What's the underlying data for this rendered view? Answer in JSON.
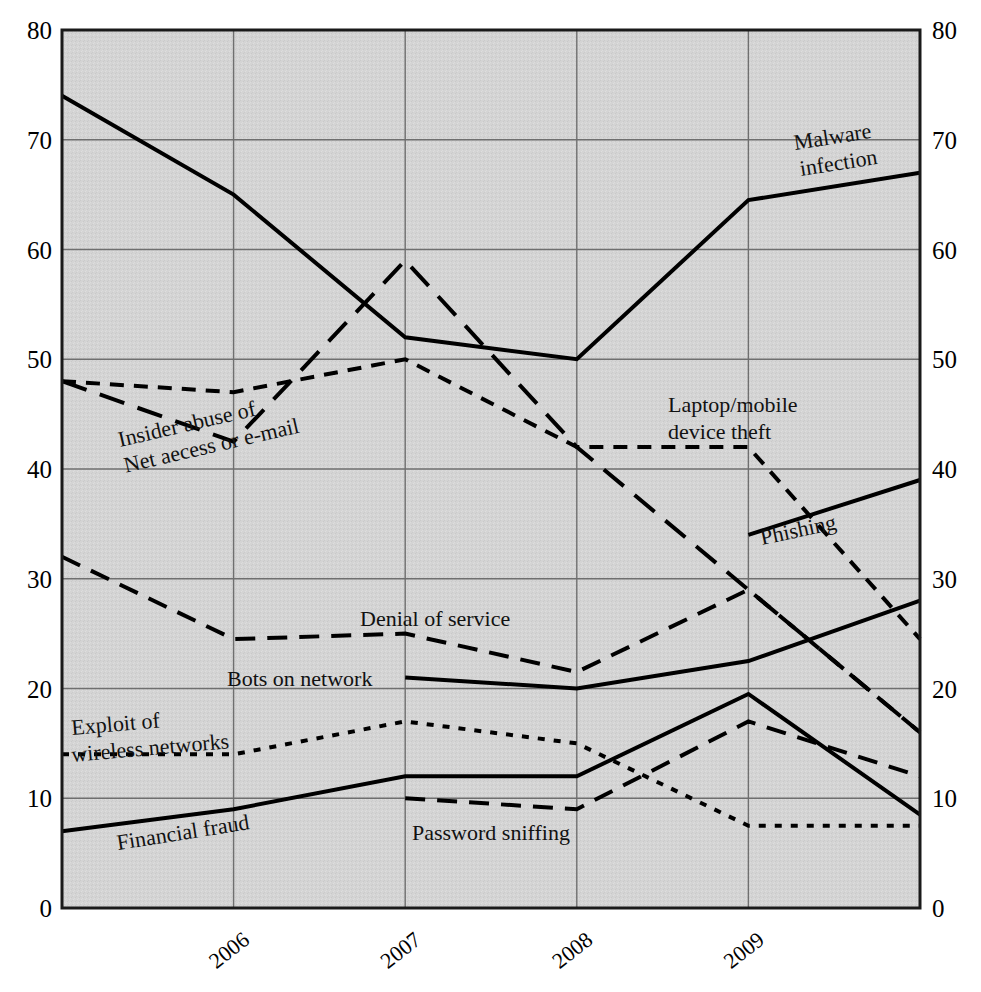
{
  "chart_data": {
    "type": "line",
    "title": "",
    "subtitle": "",
    "xlabel": "",
    "ylabel": "",
    "xlim": [
      2005,
      2010
    ],
    "ylim": [
      0,
      80
    ],
    "grid": true,
    "legend_position": "inline-annotations",
    "plot_background": "#d4d4d4",
    "x": [
      2005,
      2006,
      2007,
      2008,
      2009,
      2010
    ],
    "x_tick_labels": [
      "2006",
      "2007",
      "2008",
      "2009"
    ],
    "x_tick_values": [
      2006,
      2007,
      2008,
      2009
    ],
    "y_tick_labels_left": [
      "80",
      "70",
      "60",
      "50",
      "40",
      "30",
      "20",
      "10",
      "0"
    ],
    "y_tick_labels_right": [
      "80",
      "70",
      "60",
      "50",
      "40",
      "30",
      "20",
      "10",
      "0"
    ],
    "y_tick_values": [
      80,
      70,
      60,
      50,
      40,
      30,
      20,
      10,
      0
    ],
    "series": [
      {
        "name": "Malware infection",
        "style": "solid",
        "color": "#000000",
        "width": 4,
        "x": [
          2005,
          2006,
          2007,
          2008,
          2009,
          2010
        ],
        "values": [
          74,
          65,
          52,
          50,
          64.5,
          67
        ],
        "label": "Malware\ninfection",
        "label_line1": "Malware",
        "label_line2": "infection",
        "label_x": 795,
        "label_y": 150,
        "label_rotate": -9
      },
      {
        "name": "Insider abuse of Net aecess or e-mail",
        "style": "dashed-long",
        "color": "#000000",
        "width": 4,
        "x": [
          2005,
          2006,
          2007,
          2008,
          2009,
          2010
        ],
        "values": [
          48,
          42.5,
          59,
          42,
          29,
          16
        ],
        "label_line1": "Insider abuse of",
        "label_line2": "Net aecess or e-mail",
        "label_x": 120,
        "label_y": 447,
        "label_rotate": -13
      },
      {
        "name": "Laptop/mobile device theft",
        "style": "dashed-short",
        "color": "#000000",
        "width": 4,
        "x": [
          2005,
          2006,
          2007,
          2008,
          2009,
          2010
        ],
        "values": [
          48,
          47,
          50,
          42,
          42,
          24.5
        ],
        "label_line1": "Laptop/mobile",
        "label_line2": "device theft",
        "label_x": 668,
        "label_y": 412,
        "label_rotate": 0
      },
      {
        "name": "Denial of service",
        "style": "dashed-med",
        "color": "#000000",
        "width": 4,
        "x": [
          2005,
          2006,
          2007,
          2008,
          2009,
          2010
        ],
        "values": [
          32,
          24.5,
          25,
          21.5,
          29,
          16
        ],
        "label_line1": "Denial of service",
        "label_line2": "",
        "label_x": 360,
        "label_y": 626,
        "label_rotate": 0
      },
      {
        "name": "Bots on network",
        "style": "solid",
        "color": "#000000",
        "width": 4,
        "x": [
          2007,
          2008,
          2009,
          2010
        ],
        "values": [
          21,
          20,
          22.5,
          28
        ],
        "label_line1": "Bots on network",
        "label_line2": "",
        "label_x": 227,
        "label_y": 686,
        "label_rotate": 0
      },
      {
        "name": "Phishing",
        "style": "solid",
        "color": "#000000",
        "width": 4,
        "x": [
          2009,
          2010
        ],
        "values": [
          34,
          39
        ],
        "label_line1": "Phishing",
        "label_line2": "",
        "label_x": 762,
        "label_y": 545,
        "label_rotate": -12
      },
      {
        "name": "Financial fraud",
        "style": "solid",
        "color": "#000000",
        "width": 4,
        "x": [
          2005,
          2006,
          2007,
          2008,
          2009,
          2010
        ],
        "values": [
          7,
          9,
          12,
          12,
          19.5,
          8.5
        ],
        "label_line1": "Financial fraud",
        "label_line2": "",
        "label_x": 118,
        "label_y": 850,
        "label_rotate": -9
      },
      {
        "name": "Exploit of wireless networks",
        "style": "dotted",
        "color": "#000000",
        "width": 4,
        "x": [
          2005,
          2006,
          2007,
          2008,
          2009,
          2010
        ],
        "values": [
          14,
          14,
          17,
          15,
          7.5,
          7.5
        ],
        "label_line1": "Exploit of",
        "label_line2": "wireless networks",
        "label_x": 72,
        "label_y": 735,
        "label_rotate": -5
      },
      {
        "name": "Password sniffing",
        "style": "dashed-med",
        "color": "#000000",
        "width": 4,
        "x": [
          2007,
          2008,
          2009,
          2010
        ],
        "values": [
          10,
          9,
          17,
          12
        ],
        "label_line1": "Password sniffing",
        "label_line2": "",
        "label_x": 412,
        "label_y": 840,
        "label_rotate": 0
      }
    ]
  },
  "axes": {
    "left_labels": [
      "80",
      "70",
      "60",
      "50",
      "40",
      "30",
      "20",
      "10",
      "0"
    ],
    "right_labels": [
      "80",
      "70",
      "60",
      "50",
      "40",
      "30",
      "20",
      "10",
      "0"
    ],
    "bottom_labels": [
      "2006",
      "2007",
      "2008",
      "2009"
    ]
  },
  "colors": {
    "plot_bg": "#d4d4d4",
    "grid": "#6f6f6f",
    "frame": "#1a1a1a",
    "line": "#000000",
    "page_bg": "#ffffff"
  }
}
